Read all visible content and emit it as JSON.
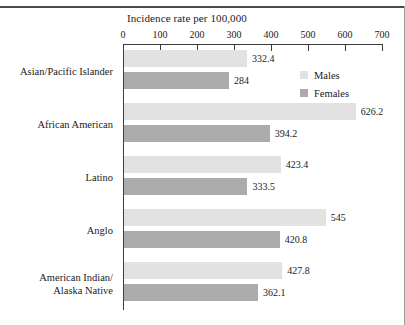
{
  "figure": {
    "title": "Incidence rate per 100,000"
  },
  "legend": {
    "position": "top-right",
    "items": [
      {
        "label": "Males",
        "color": "#e2e2e2",
        "swatch_name": "legend-swatch-males"
      },
      {
        "label": "Females",
        "color": "#ababab",
        "swatch_name": "legend-swatch-females"
      }
    ]
  },
  "axis": {
    "ticks": [
      "0",
      "100",
      "200",
      "300",
      "400",
      "500",
      "600",
      "700"
    ],
    "min": 0,
    "max": 700,
    "step": 100
  },
  "chart_data": {
    "type": "bar",
    "orientation": "horizontal",
    "title": "Incidence rate per 100,000",
    "xlabel": "Incidence rate per 100,000",
    "ylabel": "",
    "xlim": [
      0,
      700
    ],
    "xticks": [
      0,
      100,
      200,
      300,
      400,
      500,
      600,
      700
    ],
    "grid": false,
    "legend_position": "top-right",
    "categories": [
      "Asian/Pacific Islander",
      "African American",
      "Latino",
      "Anglo",
      "American Indian/\nAlaska Native"
    ],
    "series": [
      {
        "name": "Males",
        "color": "#e2e2e2",
        "values": [
          332.4,
          626.2,
          423.4,
          545,
          427.8
        ],
        "labels": [
          "332.4",
          "626.2",
          "423.4",
          "545",
          "427.8"
        ]
      },
      {
        "name": "Females",
        "color": "#ababab",
        "values": [
          284,
          394.2,
          333.5,
          420.8,
          362.1
        ],
        "labels": [
          "284",
          "394.2",
          "333.5",
          "420.8",
          "362.1"
        ]
      }
    ]
  },
  "groups": [
    {
      "label_line1": "Asian/Pacific Islander",
      "label_line2": "",
      "males": {
        "value": 332.4,
        "label": "332.4"
      },
      "females": {
        "value": 284,
        "label": "284"
      }
    },
    {
      "label_line1": "African American",
      "label_line2": "",
      "males": {
        "value": 626.2,
        "label": "626.2"
      },
      "females": {
        "value": 394.2,
        "label": "394.2"
      }
    },
    {
      "label_line1": "Latino",
      "label_line2": "",
      "males": {
        "value": 423.4,
        "label": "423.4"
      },
      "females": {
        "value": 333.5,
        "label": "333.5"
      }
    },
    {
      "label_line1": "Anglo",
      "label_line2": "",
      "males": {
        "value": 545,
        "label": "545"
      },
      "females": {
        "value": 420.8,
        "label": "420.8"
      }
    },
    {
      "label_line1": "American Indian/",
      "label_line2": "Alaska Native",
      "males": {
        "value": 427.8,
        "label": "427.8"
      },
      "females": {
        "value": 362.1,
        "label": "362.1"
      }
    }
  ]
}
